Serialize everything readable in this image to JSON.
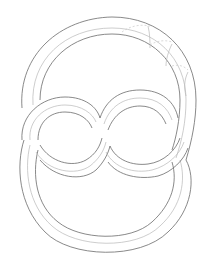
{
  "figure": {
    "colors": {
      "background": "#ffffff",
      "outline": "#6b6b6b",
      "center_line": "#b8b8b8",
      "hatching": "#c8c8c8"
    }
  }
}
